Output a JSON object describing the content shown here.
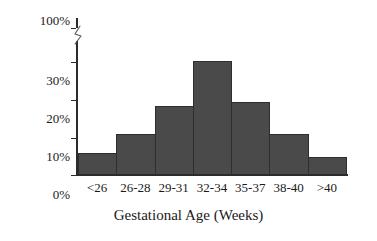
{
  "chart_data": {
    "type": "bar",
    "title": "",
    "xlabel": "Gestational Age (Weeks)",
    "ylabel": "Percent of Population",
    "categories": [
      "<26",
      "26-28",
      "29-31",
      "32-34",
      "35-37",
      "38-40",
      ">40"
    ],
    "values": [
      5.5,
      10.5,
      18,
      30,
      19,
      10.5,
      4.5
    ],
    "value_unit": "%",
    "ylim": [
      0,
      30
    ],
    "y_ticks": [
      "0%",
      "10%",
      "20%",
      "30%",
      "100%"
    ],
    "y_tick_values": [
      0,
      10,
      20,
      30,
      100
    ],
    "y_axis_break": true,
    "y_axis_break_between": [
      30,
      100
    ],
    "grid": false,
    "legend": false,
    "legend_position": "none",
    "bar_color": "#4a4a4a",
    "bar_edge_color": "#2e2e2e",
    "axis_color": "#2b2b2b",
    "background_color": "#ffffff"
  },
  "axes": {
    "y_title": "Percent of Population",
    "x_title": "Gestational Age (Weeks)",
    "y_ticks": [
      {
        "label": "100%",
        "value": 100
      },
      {
        "label": "30%",
        "value": 30
      },
      {
        "label": "20%",
        "value": 20
      },
      {
        "label": "10%",
        "value": 10
      },
      {
        "label": "0%",
        "value": 0
      }
    ]
  }
}
